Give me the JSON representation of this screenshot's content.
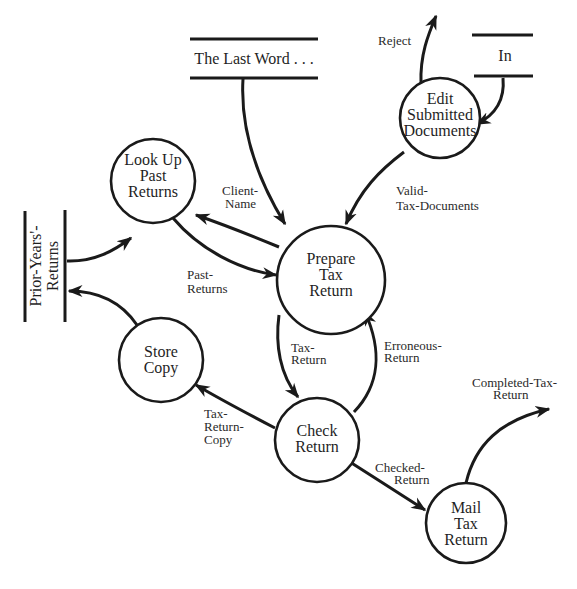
{
  "diagram": {
    "type": "data-flow-diagram",
    "processes": [
      {
        "id": "edit",
        "lines": [
          "Edit",
          "Submitted",
          "Documents"
        ]
      },
      {
        "id": "lookup",
        "lines": [
          "Look Up",
          "Past",
          "Returns"
        ]
      },
      {
        "id": "prepare",
        "lines": [
          "Prepare",
          "Tax",
          "Return"
        ]
      },
      {
        "id": "store",
        "lines": [
          "Store",
          "Copy"
        ]
      },
      {
        "id": "check",
        "lines": [
          "Check",
          "Return"
        ]
      },
      {
        "id": "mail",
        "lines": [
          "Mail",
          "Tax",
          "Return"
        ]
      }
    ],
    "stores": [
      {
        "id": "lastword",
        "label": "The Last Word . . ."
      },
      {
        "id": "in",
        "label": "In"
      },
      {
        "id": "prior",
        "lines": [
          "Prior-Years'-",
          "Returns"
        ]
      }
    ],
    "flows": [
      {
        "id": "reject",
        "from": "edit",
        "to": "external",
        "lines": [
          "Reject"
        ]
      },
      {
        "id": "in-edit",
        "from": "in",
        "to": "edit",
        "lines": []
      },
      {
        "id": "lastword-prepare",
        "from": "lastword",
        "to": "prepare",
        "lines": []
      },
      {
        "id": "valid",
        "from": "edit",
        "to": "prepare",
        "lines": [
          "Valid-",
          "Tax-Documents"
        ]
      },
      {
        "id": "clientname",
        "from": "prepare",
        "to": "lookup",
        "lines": [
          "Client-",
          "Name"
        ]
      },
      {
        "id": "pastreturns",
        "from": "lookup",
        "to": "prepare",
        "lines": [
          "Past-",
          "Returns"
        ]
      },
      {
        "id": "prior-lookup",
        "from": "prior",
        "to": "lookup",
        "lines": []
      },
      {
        "id": "store-prior",
        "from": "store",
        "to": "prior",
        "lines": []
      },
      {
        "id": "taxreturn",
        "from": "prepare",
        "to": "check",
        "lines": [
          "Tax-",
          "Return"
        ]
      },
      {
        "id": "erroneous",
        "from": "check",
        "to": "prepare",
        "lines": [
          "Erroneous-",
          "Return"
        ]
      },
      {
        "id": "copy",
        "from": "check",
        "to": "store",
        "lines": [
          "Tax-",
          "Return-",
          "Copy"
        ]
      },
      {
        "id": "checked",
        "from": "check",
        "to": "mail",
        "lines": [
          "Checked-",
          "Return"
        ]
      },
      {
        "id": "completed",
        "from": "mail",
        "to": "external",
        "lines": [
          "Completed-Tax-",
          "Return"
        ]
      }
    ],
    "colors": {
      "ink": "#1a1a1a",
      "background": "#ffffff"
    }
  }
}
